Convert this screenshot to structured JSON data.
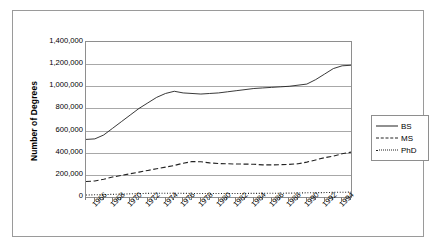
{
  "chart_data": {
    "type": "line",
    "title": "",
    "xlabel": "",
    "ylabel": "Number of Degrees",
    "ylim": [
      0,
      1400000
    ],
    "xlim": [
      1965,
      1995
    ],
    "grid": true,
    "legend_position": "right",
    "y_ticks": [
      "0",
      "200,000",
      "400,000",
      "600,000",
      "800,000",
      "1,000,000",
      "1,200,000",
      "1,400,000"
    ],
    "y_tick_values": [
      0,
      200000,
      400000,
      600000,
      800000,
      1000000,
      1200000,
      1400000
    ],
    "x_tick_labels": [
      "1966",
      "1968",
      "1970",
      "1972",
      "1974",
      "1976",
      "1978",
      "1980",
      "1982",
      "1984",
      "1986",
      "1988",
      "1990",
      "1992",
      "1994"
    ],
    "x": [
      1965,
      1966,
      1967,
      1968,
      1969,
      1970,
      1971,
      1972,
      1973,
      1974,
      1975,
      1976,
      1977,
      1978,
      1979,
      1980,
      1981,
      1982,
      1983,
      1984,
      1985,
      1986,
      1987,
      1988,
      1989,
      1990,
      1991,
      1992,
      1993,
      1994,
      1995
    ],
    "series": [
      {
        "name": "BS",
        "style": "solid",
        "color": "#222222",
        "values": [
          520000,
          525000,
          560000,
          620000,
          680000,
          740000,
          800000,
          850000,
          900000,
          935000,
          955000,
          940000,
          935000,
          930000,
          935000,
          940000,
          950000,
          960000,
          970000,
          980000,
          985000,
          990000,
          995000,
          1000000,
          1010000,
          1020000,
          1060000,
          1110000,
          1160000,
          1185000,
          1190000
        ]
      },
      {
        "name": "MS",
        "style": "dashed",
        "color": "#222222",
        "values": [
          140000,
          145000,
          160000,
          180000,
          195000,
          210000,
          225000,
          240000,
          255000,
          270000,
          285000,
          305000,
          320000,
          318000,
          308000,
          302000,
          300000,
          298000,
          297000,
          296000,
          290000,
          290000,
          292000,
          295000,
          300000,
          315000,
          335000,
          355000,
          370000,
          390000,
          405000
        ]
      },
      {
        "name": "PhD",
        "style": "dotted",
        "color": "#222222",
        "values": [
          18000,
          20000,
          22000,
          24000,
          26000,
          29000,
          31000,
          33000,
          34000,
          34000,
          34000,
          33000,
          32000,
          32000,
          32000,
          32000,
          32000,
          32000,
          32000,
          33000,
          33000,
          34000,
          34000,
          35000,
          36000,
          38000,
          39000,
          40000,
          42000,
          43000,
          44000
        ]
      }
    ],
    "legend": [
      {
        "label": "BS",
        "style": "solid"
      },
      {
        "label": "MS",
        "style": "dashed"
      },
      {
        "label": "PhD",
        "style": "dotted"
      }
    ]
  }
}
